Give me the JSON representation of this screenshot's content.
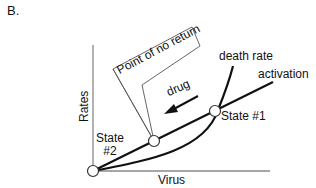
{
  "panel_label": "B.",
  "axes": {
    "y_label": "Rates",
    "x_label": "Virus"
  },
  "curves": {
    "death_rate": "death rate",
    "activation": "activation"
  },
  "states": {
    "state1": "State #1",
    "state2_line1": "State",
    "state2_line2": "#2"
  },
  "annotations": {
    "drug": "drug",
    "callout": "Point of no return"
  },
  "colors": {
    "axis": "#888888",
    "curve": "#111111",
    "callout_border": "#555555"
  }
}
